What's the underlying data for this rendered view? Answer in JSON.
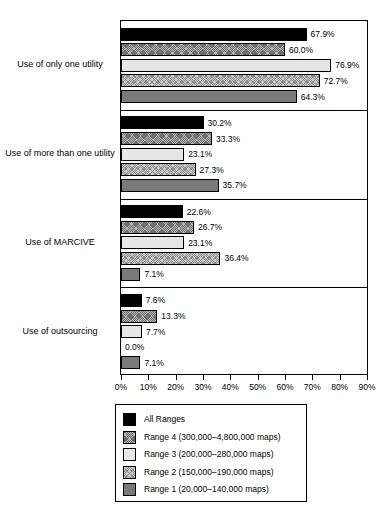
{
  "chart_data": {
    "type": "bar",
    "orientation": "horizontal",
    "title": "",
    "xlabel": "",
    "ylabel": "",
    "xlim": [
      0,
      90
    ],
    "grid": false,
    "legend_position": "bottom",
    "tick_labels": [
      "0%",
      "10%",
      "20%",
      "30%",
      "40%",
      "50%",
      "60%",
      "70%",
      "80%",
      "90%"
    ],
    "tick_values": [
      0,
      10,
      20,
      30,
      40,
      50,
      60,
      70,
      80,
      90
    ],
    "categories": [
      "Use of only one utility",
      "Use of more than one utility",
      "Use of MARCIVE",
      "Use of outsourcing"
    ],
    "series": [
      {
        "name": "All Ranges",
        "fill": "solid-black",
        "values": [
          67.9,
          30.2,
          22.6,
          7.6
        ],
        "labels": [
          "67.9%",
          "30.2%",
          "22.6%",
          "7.6%"
        ]
      },
      {
        "name": "Range 4 (300,000–4,800,000 maps)",
        "fill": "dark-hatch",
        "values": [
          60.0,
          33.3,
          26.7,
          13.3
        ],
        "labels": [
          "60.0%",
          "33.3%",
          "26.7%",
          "13.3%"
        ]
      },
      {
        "name": "Range 3 (200,000–280,000 maps)",
        "fill": "very-light",
        "values": [
          76.9,
          23.1,
          23.1,
          7.7
        ],
        "labels": [
          "76.9%",
          "23.1%",
          "23.1%",
          "7.7%"
        ]
      },
      {
        "name": "Range 2 (150,000–190,000 maps)",
        "fill": "light-hatch",
        "values": [
          72.7,
          27.3,
          36.4,
          0.0
        ],
        "labels": [
          "72.7%",
          "27.3%",
          "36.4%",
          "0.0%"
        ]
      },
      {
        "name": "Range 1 (20,000–140,000 maps)",
        "fill": "mid-gray",
        "values": [
          64.3,
          35.7,
          7.1,
          7.1
        ],
        "labels": [
          "64.3%",
          "35.7%",
          "7.1%",
          "7.1%"
        ]
      }
    ]
  },
  "legend": {
    "entries": [
      {
        "label": "All Ranges",
        "fill": "solid-black"
      },
      {
        "label": "Range 4 (300,000–4,800,000 maps)",
        "fill": "dark-hatch"
      },
      {
        "label": "Range 3 (200,000–280,000 maps)",
        "fill": "very-light"
      },
      {
        "label": "Range 2 (150,000–190,000 maps)",
        "fill": "light-hatch"
      },
      {
        "label": "Range 1 (20,000–140,000 maps)",
        "fill": "mid-gray"
      }
    ]
  },
  "colors": {
    "solid_black": "#000000",
    "dark_hatch": "#b4b4b4",
    "very_light": "#e6e6e6",
    "light_hatch": "#c8c8c8",
    "mid_gray": "#7a7a7a",
    "axis": "#000000",
    "background": "#ffffff"
  }
}
